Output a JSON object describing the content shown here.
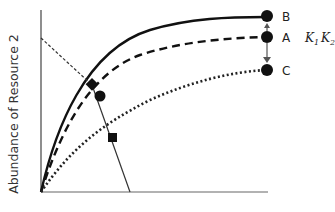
{
  "diagram": {
    "y_axis_label": "Abundance of Resource 2",
    "x_axis_label": "",
    "curves": [
      {
        "id": "B",
        "name": "solid curve",
        "style": "solid",
        "end_label": "B",
        "end_level": 1.0
      },
      {
        "id": "A",
        "name": "dashed curve",
        "style": "dashed",
        "end_label": "A",
        "end_level": 0.88
      },
      {
        "id": "C",
        "name": "dotted curve",
        "style": "dotted",
        "end_label": "C",
        "end_level": 0.55
      }
    ],
    "k_annotation": {
      "k1": "K",
      "k1_sub": "1",
      "k2": "K",
      "k2_sub": "2"
    },
    "markers": [
      {
        "shape": "diamond",
        "on_curve": "B"
      },
      {
        "shape": "circle",
        "on_curve": "A"
      },
      {
        "shape": "square",
        "on_curve": "C"
      }
    ],
    "arrows": [
      {
        "from": "A",
        "to": "B",
        "direction": "up"
      },
      {
        "from": "A",
        "to": "C",
        "direction": "down"
      }
    ],
    "lines": [
      {
        "name": "dotted diagonal from y-axis to diamond",
        "style": "dotted-thin"
      },
      {
        "name": "solid diagonal from diamond through square to x-axis",
        "style": "solid-thin"
      }
    ]
  }
}
